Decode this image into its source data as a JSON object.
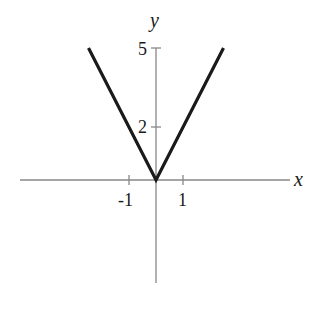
{
  "chart_data": {
    "type": "line",
    "title": "",
    "xlabel": "x",
    "ylabel": "y",
    "function": "y = 2|x|",
    "series": [
      {
        "name": "y = 2|x|",
        "x": [
          -2.5,
          0,
          2.5
        ],
        "y": [
          5,
          0,
          5
        ]
      }
    ],
    "x_ticks": [
      {
        "value": -1,
        "label": "-1"
      },
      {
        "value": 1,
        "label": "1"
      }
    ],
    "y_ticks": [
      {
        "value": 2,
        "label": "2"
      },
      {
        "value": 5,
        "label": "5"
      }
    ],
    "xlim": [
      -5.1,
      5
    ],
    "ylim": [
      -3.9,
      5
    ],
    "grid": false,
    "legend": null,
    "colors": {
      "curve": "#1a1a1a",
      "axes": "#888888"
    }
  }
}
